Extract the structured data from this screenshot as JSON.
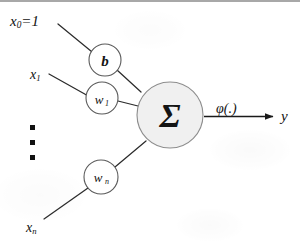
{
  "diagram": {
    "background_color": "#ffffff",
    "ink_color": "#141414",
    "line_color": "#2b2b2b",
    "sum_node_fill": "#f0f0f0",
    "sum_node_stroke": "#8d8d8d",
    "weight_node_fill": "#ffffff",
    "weight_node_stroke": "#5a5a5a"
  },
  "inputs": [
    {
      "id": "x0",
      "label_base": "x",
      "label_sub": "0",
      "label_suffix": "=1",
      "label_full": "x₀=1"
    },
    {
      "id": "x1",
      "label_base": "x",
      "label_sub": "1",
      "label_suffix": "",
      "label_full": "x₁"
    },
    {
      "id": "xn",
      "label_base": "x",
      "label_sub": "n",
      "label_suffix": "",
      "label_full": "xₙ"
    }
  ],
  "nodes": [
    {
      "id": "bias",
      "label_base": "b",
      "label_sub": "",
      "label_full": "b"
    },
    {
      "id": "w1",
      "label_base": "w",
      "label_sub": "1",
      "label_full": "w₁"
    },
    {
      "id": "wn",
      "label_base": "w",
      "label_sub": "n",
      "label_full": "wₙ"
    }
  ],
  "summation": {
    "symbol": "Σ",
    "name": "summation-node"
  },
  "activation": {
    "label": "φ(.)",
    "name": "activation-function-label"
  },
  "output": {
    "label": "y",
    "name": "output-label"
  },
  "ellipsis": {
    "label": "▪",
    "count": 3,
    "meaning": "vertical-dots-continuation"
  }
}
